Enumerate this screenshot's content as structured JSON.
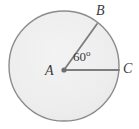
{
  "figure": {
    "type": "circle-sector-diagram",
    "background_color": "#ffffff",
    "circle": {
      "name": "circle-A",
      "center_label": "A",
      "center_x": 64,
      "center_y": 66,
      "radius": 55,
      "fill_color": "#ededed",
      "stroke_color": "#8c8c8c",
      "stroke_width": 1.4
    },
    "center_point": {
      "name": "point-A",
      "x": 64,
      "y": 70,
      "dot_radius": 2.6,
      "color": "#6f6f6f"
    },
    "radii": [
      {
        "name": "radius-AB",
        "from_label": "A",
        "to_label": "B",
        "x1": 64,
        "y1": 70,
        "x2": 97,
        "y2": 24,
        "stroke_color": "#7e7e7e",
        "stroke_width": 1.8
      },
      {
        "name": "radius-AC",
        "from_label": "A",
        "to_label": "C",
        "x1": 64,
        "y1": 70,
        "x2": 119,
        "y2": 70,
        "stroke_color": "#7e7e7e",
        "stroke_width": 1.8
      }
    ],
    "labels": {
      "center": "A",
      "point_b": "B",
      "point_c": "C"
    },
    "angle": {
      "name": "angle-BAC",
      "value": "60",
      "unit": "o",
      "text": "60o",
      "vertex": "A",
      "ray_1": "B",
      "ray_2": "C",
      "color": "#3b3b3b"
    }
  }
}
